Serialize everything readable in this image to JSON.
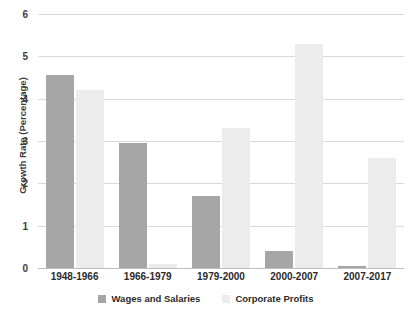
{
  "chart_data": {
    "type": "bar",
    "title": "",
    "xlabel": "",
    "ylabel": "Growth Rate (Percentage)",
    "ylim": [
      0,
      6
    ],
    "yticks": [
      0,
      1,
      2,
      3,
      4,
      5,
      6
    ],
    "ytick_labels": [
      "0",
      "1",
      "2",
      "3",
      "4",
      "5",
      "6"
    ],
    "grid": true,
    "legend_position": "bottom",
    "categories": [
      "1948-1966",
      "1966-1979",
      "1979-2000",
      "2000-2007",
      "2007-2017"
    ],
    "series": [
      {
        "name": "Wages and Salaries",
        "color": "#a6a6a6",
        "values": [
          4.55,
          2.95,
          1.7,
          0.4,
          0.05
        ]
      },
      {
        "name": "Corporate Profits",
        "color": "#ececec",
        "values": [
          4.2,
          0.1,
          3.3,
          5.3,
          2.6
        ]
      }
    ]
  },
  "colors": {
    "wages": "#a6a6a6",
    "profits": "#ececec",
    "gridline": "#d9d9d9",
    "baseline": "#bfbfbf",
    "text": "#2b2b2b",
    "background": "#ffffff"
  }
}
